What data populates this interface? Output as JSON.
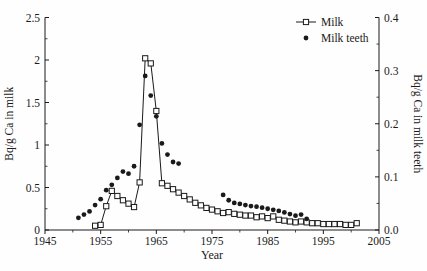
{
  "figure": {
    "background": "#fefefe",
    "ink_color": "#1a1a1a"
  },
  "chart_data": {
    "type": "line",
    "title": "",
    "xlabel": "Year",
    "ylabel_left": "Bq/g Ca in milk",
    "ylabel_right": "Bq/g Ca in milk teeth",
    "xlim": [
      1945,
      2005
    ],
    "x_ticks": [
      1945,
      1955,
      1965,
      1975,
      1985,
      1995,
      2005
    ],
    "x_minor_step": 5,
    "ylim_left": [
      0,
      2.5
    ],
    "left_ticks": [
      0,
      0.5,
      1,
      1.5,
      2,
      2.5
    ],
    "left_minor_step": 0.25,
    "ylim_right": [
      0,
      0.4
    ],
    "right_ticks": [
      0.0,
      0.1,
      0.2,
      0.3,
      0.4
    ],
    "right_minor_step": 0.05,
    "grid": false,
    "legend": {
      "position": "top-right",
      "items": [
        {
          "label": "Milk",
          "marker": "open-square-with-line"
        },
        {
          "label": "Milk teeth",
          "marker": "filled-circle"
        }
      ]
    },
    "series": [
      {
        "name": "Milk",
        "axis": "left",
        "marker": "open-square",
        "line": true,
        "color": "#1a1a1a",
        "points": [
          [
            1954,
            0.05
          ],
          [
            1955,
            0.06
          ],
          [
            1956,
            0.28
          ],
          [
            1957,
            0.46
          ],
          [
            1958,
            0.4
          ],
          [
            1959,
            0.35
          ],
          [
            1960,
            0.31
          ],
          [
            1961,
            0.27
          ],
          [
            1962,
            0.56
          ],
          [
            1963,
            2.02
          ],
          [
            1964,
            1.96
          ],
          [
            1965,
            1.4
          ],
          [
            1966,
            0.55
          ],
          [
            1967,
            0.52
          ],
          [
            1968,
            0.48
          ],
          [
            1969,
            0.44
          ],
          [
            1970,
            0.4
          ],
          [
            1971,
            0.36
          ],
          [
            1972,
            0.32
          ],
          [
            1973,
            0.29
          ],
          [
            1974,
            0.26
          ],
          [
            1975,
            0.24
          ],
          [
            1976,
            0.22
          ],
          [
            1977,
            0.2
          ],
          [
            1978,
            0.21
          ],
          [
            1979,
            0.19
          ],
          [
            1980,
            0.18
          ],
          [
            1981,
            0.17
          ],
          [
            1982,
            0.17
          ],
          [
            1983,
            0.15
          ],
          [
            1984,
            0.16
          ],
          [
            1985,
            0.14
          ],
          [
            1986,
            0.16
          ],
          [
            1987,
            0.12
          ],
          [
            1988,
            0.11
          ],
          [
            1989,
            0.1
          ],
          [
            1990,
            0.09
          ],
          [
            1991,
            0.1
          ],
          [
            1992,
            0.09
          ],
          [
            1993,
            0.08
          ],
          [
            1994,
            0.08
          ],
          [
            1995,
            0.07
          ],
          [
            1996,
            0.07
          ],
          [
            1997,
            0.07
          ],
          [
            1998,
            0.07
          ],
          [
            1999,
            0.06
          ],
          [
            2000,
            0.06
          ],
          [
            2001,
            0.08
          ]
        ]
      },
      {
        "name": "Milk teeth",
        "axis": "right",
        "marker": "filled-circle",
        "line": false,
        "color": "#1a1a1a",
        "points": [
          [
            1951,
            0.023
          ],
          [
            1952,
            0.029
          ],
          [
            1953,
            0.035
          ],
          [
            1954,
            0.047
          ],
          [
            1955,
            0.058
          ],
          [
            1956,
            0.075
          ],
          [
            1957,
            0.085
          ],
          [
            1958,
            0.098
          ],
          [
            1959,
            0.11
          ],
          [
            1960,
            0.106
          ],
          [
            1961,
            0.12
          ],
          [
            1962,
            0.198
          ],
          [
            1963,
            0.29
          ],
          [
            1964,
            0.253
          ],
          [
            1965,
            0.214
          ],
          [
            1966,
            0.163
          ],
          [
            1967,
            0.142
          ],
          [
            1968,
            0.128
          ],
          [
            1969,
            0.125
          ],
          [
            1977,
            0.066
          ],
          [
            1978,
            0.056
          ],
          [
            1979,
            0.051
          ],
          [
            1980,
            0.049
          ],
          [
            1981,
            0.047
          ],
          [
            1982,
            0.045
          ],
          [
            1983,
            0.044
          ],
          [
            1984,
            0.042
          ],
          [
            1985,
            0.04
          ],
          [
            1986,
            0.038
          ],
          [
            1987,
            0.036
          ],
          [
            1988,
            0.033
          ],
          [
            1989,
            0.03
          ],
          [
            1990,
            0.027
          ],
          [
            1991,
            0.029
          ],
          [
            1992,
            0.021
          ]
        ]
      }
    ]
  }
}
